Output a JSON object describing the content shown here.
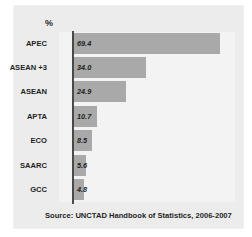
{
  "credit": "Sciences Po / CERI et Atelier de cartographie, March 2008",
  "unit_label": "%",
  "source": "Source: UNCTAD Handbook of Statistics, 2006-2007",
  "colors": {
    "bar": "#a9a9a9",
    "plot_background": "#f3f3f3",
    "panel_background": "#ececed",
    "axis": "#4a4a4a",
    "text": "#1f1f1f"
  },
  "chart_data": {
    "type": "bar",
    "orientation": "horizontal",
    "title": "",
    "subtitle": "",
    "xlabel": "%",
    "ylabel": "",
    "categories": [
      "APEC",
      "ASEAN +3",
      "ASEAN",
      "APTA",
      "ECO",
      "SAARC",
      "GCC"
    ],
    "values": [
      69.4,
      34.0,
      24.9,
      10.7,
      8.5,
      5.6,
      4.8
    ],
    "value_labels": [
      "69.4",
      "34.0",
      "24.9",
      "10.7",
      "8.5",
      "5.6",
      "4.8"
    ],
    "xlim": [
      0,
      75
    ],
    "grid": false,
    "legend": null,
    "annotations": [
      "Source: UNCTAD Handbook of Statistics, 2006-2007"
    ]
  }
}
